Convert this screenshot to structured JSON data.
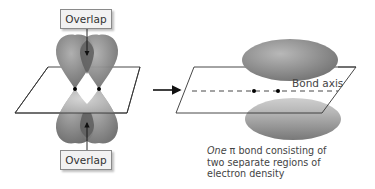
{
  "left_panel": {
    "overlap_top_label": "Overlap",
    "overlap_bottom_label": "Overlap",
    "description": "Two parallel p orbitals overlapping side by side above and below the nodal plane"
  },
  "transition_arrow": "right-arrow",
  "right_panel": {
    "axis_label": "Bond axis",
    "caption": {
      "emphasis": "One",
      "symbol": "π",
      "line1_rest": " bond consisting of",
      "line2": "two separate regions of",
      "line3": "electron density"
    }
  },
  "colors": {
    "lobe_dark": "#7c7c7c",
    "lobe_mid": "#9a9a9a",
    "lobe_light": "#c2c2c2",
    "overlap": "#5e5e5e",
    "plane_stroke": "#333333",
    "box_fill": "#f2f2f2"
  }
}
